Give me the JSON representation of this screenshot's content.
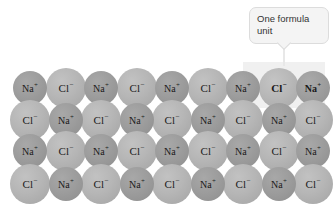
{
  "figure": {
    "background_color": "#ffffff"
  },
  "callout": {
    "label": "One formula unit",
    "background_color": "#f4f4f4",
    "border_color": "#dcdcdc",
    "leader_line_color": "#e8e8e8"
  },
  "highlight": {
    "color": "#f0f0f0"
  },
  "ions": {
    "cation": {
      "symbol": "Na",
      "charge": "+",
      "name": "sodium-ion",
      "color": "#9d9d9d",
      "radius_px": 17
    },
    "anion": {
      "symbol": "Cl",
      "charge": "−",
      "name": "chloride-ion",
      "color": "#b6b6b6",
      "radius_px": 20
    }
  },
  "lattice": {
    "rows": 4,
    "columns": 9,
    "grid": [
      [
        "cation",
        "anion",
        "cation",
        "anion",
        "cation",
        "anion",
        "cation",
        "anion",
        "cation"
      ],
      [
        "anion",
        "cation",
        "anion",
        "cation",
        "anion",
        "cation",
        "anion",
        "cation",
        "anion"
      ],
      [
        "cation",
        "anion",
        "cation",
        "anion",
        "cation",
        "anion",
        "cation",
        "anion",
        "cation"
      ],
      [
        "anion",
        "cation",
        "anion",
        "cation",
        "anion",
        "cation",
        "anion",
        "cation",
        "anion"
      ]
    ],
    "emphasized": [
      [
        0,
        7
      ],
      [
        0,
        8
      ]
    ],
    "labels": [
      [
        "Na+",
        "Cl−",
        "Na+",
        "Cl−",
        "Na+",
        "Cl−",
        "Na+",
        "Cl−",
        "Na+"
      ],
      [
        "Cl−",
        "Na+",
        "Cl−",
        "Na+",
        "Cl−",
        "Na+",
        "Cl−",
        "Na+",
        "Cl−"
      ],
      [
        "Na+",
        "Cl−",
        "Na+",
        "Cl−",
        "Na+",
        "Cl−",
        "Na+",
        "Cl−",
        "Na+"
      ],
      [
        "Cl−",
        "Na+",
        "Cl−",
        "Na+",
        "Cl−",
        "Na+",
        "Cl−",
        "Na+",
        "Cl−"
      ]
    ]
  }
}
